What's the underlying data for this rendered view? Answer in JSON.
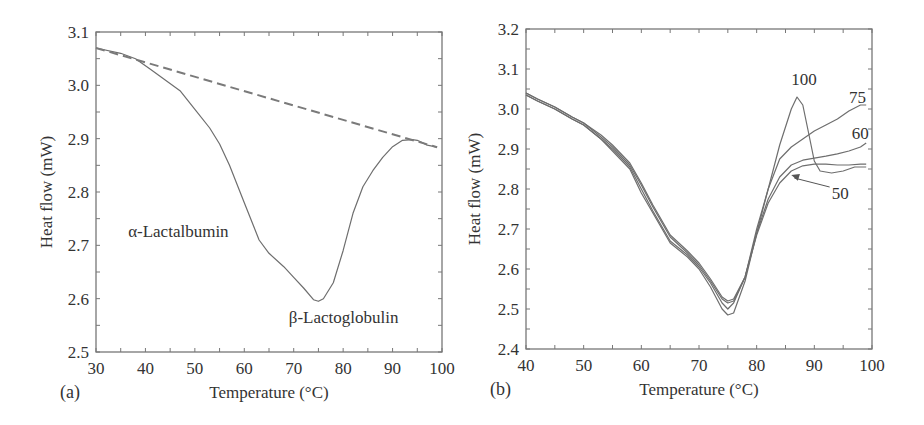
{
  "chart_data": [
    {
      "panel_label": "(a)",
      "type": "line",
      "title": "",
      "xlabel": "Temperature (°C)",
      "ylabel": "Heat flow (mW)",
      "xlim": [
        30,
        100
      ],
      "ylim": [
        2.5,
        3.1
      ],
      "xticks": [
        30,
        40,
        50,
        60,
        70,
        80,
        90,
        100
      ],
      "yticks": [
        2.5,
        2.6,
        2.7,
        2.8,
        2.9,
        3.0,
        3.1
      ],
      "xtick_labels": [
        "30",
        "40",
        "50",
        "60",
        "70",
        "80",
        "90",
        "100"
      ],
      "ytick_labels": [
        "2.5",
        "2.6",
        "2.7",
        "2.8",
        "2.9",
        "3.0",
        "3.1"
      ],
      "grid": false,
      "series": [
        {
          "name": "DSC thermogram",
          "style": "solid",
          "x": [
            30,
            35,
            38,
            41,
            44,
            47,
            50,
            53,
            55,
            57,
            60,
            63,
            65,
            68,
            70,
            72,
            74,
            75,
            76,
            78,
            80,
            82,
            84,
            86,
            88,
            90,
            92,
            94,
            95,
            97,
            99
          ],
          "y": [
            3.07,
            3.06,
            3.05,
            3.03,
            3.01,
            2.99,
            2.955,
            2.92,
            2.89,
            2.85,
            2.78,
            2.71,
            2.685,
            2.66,
            2.64,
            2.62,
            2.598,
            2.595,
            2.6,
            2.63,
            2.69,
            2.76,
            2.81,
            2.84,
            2.865,
            2.885,
            2.897,
            2.898,
            2.897,
            2.888,
            2.884
          ]
        },
        {
          "name": "Baseline",
          "style": "dashed",
          "x": [
            30,
            99
          ],
          "y": [
            3.07,
            2.884
          ]
        }
      ],
      "annotations": [
        {
          "text": "α-Lactalbumin",
          "x": 36.5,
          "y": 2.715
        },
        {
          "text": "β-Lactoglobulin",
          "x": 69,
          "y": 2.555
        }
      ]
    },
    {
      "panel_label": "(b)",
      "type": "line",
      "title": "",
      "xlabel": "Temperature (°C)",
      "ylabel": "Heat flow (mW)",
      "xlim": [
        40,
        100
      ],
      "ylim": [
        2.4,
        3.2
      ],
      "xticks": [
        40,
        50,
        60,
        70,
        80,
        90,
        100
      ],
      "yticks": [
        2.4,
        2.5,
        2.6,
        2.7,
        2.8,
        2.9,
        3.0,
        3.1,
        3.2
      ],
      "xtick_labels": [
        "40",
        "50",
        "60",
        "70",
        "80",
        "90",
        "100"
      ],
      "ytick_labels": [
        "2.4",
        "2.5",
        "2.6",
        "2.7",
        "2.8",
        "2.9",
        "3.0",
        "3.1",
        "3.2"
      ],
      "grid": false,
      "series": [
        {
          "name": "100",
          "x": [
            40,
            42,
            45,
            48,
            50,
            53,
            55,
            58,
            60,
            62,
            65,
            68,
            70,
            72,
            74,
            75,
            76,
            78,
            80,
            82,
            84,
            86,
            87,
            88,
            89,
            90,
            91,
            93,
            95,
            97,
            99
          ],
          "y": [
            3.035,
            3.02,
            3.0,
            2.975,
            2.96,
            2.925,
            2.895,
            2.85,
            2.79,
            2.74,
            2.665,
            2.63,
            2.6,
            2.555,
            2.5,
            2.485,
            2.49,
            2.57,
            2.69,
            2.8,
            2.91,
            3.0,
            3.03,
            3.01,
            2.94,
            2.87,
            2.845,
            2.84,
            2.845,
            2.855,
            2.855
          ]
        },
        {
          "name": "75",
          "x": [
            40,
            42,
            45,
            48,
            50,
            53,
            55,
            58,
            60,
            62,
            65,
            68,
            70,
            72,
            74,
            75,
            76,
            78,
            80,
            82,
            84,
            86,
            88,
            90,
            92,
            94,
            96,
            98,
            99
          ],
          "y": [
            3.035,
            3.02,
            3.0,
            2.975,
            2.96,
            2.925,
            2.9,
            2.855,
            2.8,
            2.745,
            2.67,
            2.635,
            2.605,
            2.565,
            2.515,
            2.5,
            2.515,
            2.58,
            2.7,
            2.8,
            2.875,
            2.905,
            2.925,
            2.945,
            2.96,
            2.975,
            2.995,
            3.01,
            3.01
          ]
        },
        {
          "name": "60",
          "x": [
            40,
            42,
            45,
            48,
            50,
            53,
            55,
            58,
            60,
            62,
            65,
            68,
            70,
            72,
            74,
            75,
            76,
            78,
            80,
            82,
            84,
            86,
            88,
            90,
            92,
            94,
            96,
            98,
            99
          ],
          "y": [
            3.04,
            3.025,
            3.005,
            2.98,
            2.965,
            2.93,
            2.905,
            2.86,
            2.81,
            2.755,
            2.68,
            2.64,
            2.61,
            2.57,
            2.525,
            2.515,
            2.52,
            2.58,
            2.69,
            2.775,
            2.83,
            2.86,
            2.872,
            2.877,
            2.882,
            2.888,
            2.895,
            2.905,
            2.915
          ]
        },
        {
          "name": "50",
          "x": [
            40,
            42,
            45,
            48,
            50,
            53,
            55,
            58,
            60,
            62,
            65,
            68,
            70,
            72,
            74,
            75,
            76,
            78,
            80,
            82,
            84,
            86,
            88,
            90,
            92,
            94,
            96,
            98,
            99
          ],
          "y": [
            3.04,
            3.025,
            3.005,
            2.98,
            2.965,
            2.935,
            2.91,
            2.865,
            2.815,
            2.76,
            2.685,
            2.645,
            2.615,
            2.575,
            2.53,
            2.52,
            2.525,
            2.58,
            2.685,
            2.765,
            2.815,
            2.845,
            2.858,
            2.862,
            2.862,
            2.86,
            2.86,
            2.862,
            2.862
          ]
        }
      ],
      "annotations": [
        {
          "text": "100",
          "x": 86,
          "y": 3.06
        },
        {
          "text": "75",
          "x": 96,
          "y": 3.014
        },
        {
          "text": "60",
          "x": 96.5,
          "y": 2.925
        },
        {
          "text": "50",
          "x": 93,
          "y": 2.775,
          "arrow_to": {
            "x": 86,
            "y": 2.835
          }
        }
      ]
    }
  ],
  "panels": {
    "a": {
      "label": "(a)"
    },
    "b": {
      "label": "(b)"
    }
  }
}
